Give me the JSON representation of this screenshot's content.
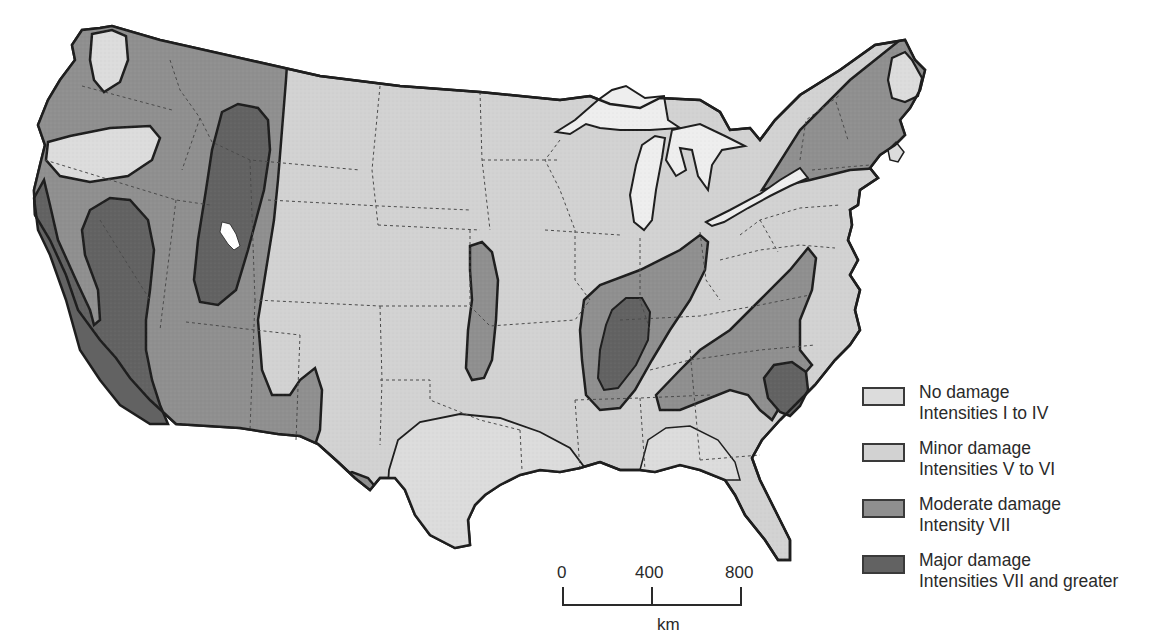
{
  "map": {
    "subject": "Earthquake damage potential, conterminous United States",
    "colors": {
      "background": "#ffffff",
      "no_damage": "#dcdcdc",
      "minor_damage": "#d2d2d2",
      "moderate_damage": "#8f8f8f",
      "major_damage": "#626262",
      "outline": "#1e1e1e",
      "state_border": "#4a4a4a",
      "water": "#eeeeee"
    }
  },
  "legend": {
    "items": [
      {
        "title": "No damage",
        "subtitle": "Intensities I to IV",
        "color": "#dcdcdc"
      },
      {
        "title": "Minor damage",
        "subtitle": "Intensities V to VI",
        "color": "#d2d2d2"
      },
      {
        "title": "Moderate damage",
        "subtitle": "Intensity VII",
        "color": "#8f8f8f"
      },
      {
        "title": "Major damage",
        "subtitle": "Intensities VII and greater",
        "color": "#626262"
      }
    ]
  },
  "scale_bar": {
    "ticks": [
      "0",
      "400",
      "800"
    ],
    "unit": "km"
  }
}
